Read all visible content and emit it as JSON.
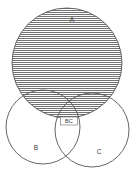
{
  "diagram": {
    "kind": "venn-diagram",
    "title": "",
    "background_color": "#ffffff",
    "stroke_color": "#555555",
    "hatch_color": "#5a5a5a",
    "label_color": "#3a3a3a",
    "canvas": {
      "width": 136,
      "height": 176
    },
    "sets": [
      {
        "id": "A",
        "label": "A",
        "cx": 67,
        "cy": 63,
        "r": 55,
        "fill": "hatched-horizontal",
        "label_x": 72,
        "label_y": 20
      },
      {
        "id": "B",
        "label": "B",
        "cx": 43,
        "cy": 127,
        "r": 37,
        "fill": "white",
        "label_x": 36,
        "label_y": 148
      },
      {
        "id": "C",
        "label": "C",
        "cx": 92,
        "cy": 130,
        "r": 37,
        "fill": "white",
        "label_x": 99,
        "label_y": 152
      }
    ],
    "region_labels": [
      {
        "id": "BC",
        "label": "BC",
        "x": 69,
        "y": 121,
        "boxed": true,
        "box_width": 17,
        "box_height": 8
      }
    ],
    "hatch": {
      "orientation": "horizontal",
      "spacing_px": 2,
      "line_width_px": 0.8
    }
  }
}
